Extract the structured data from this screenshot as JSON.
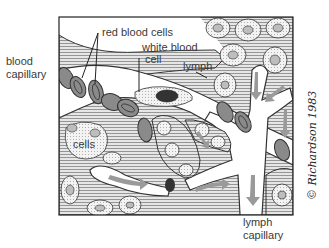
{
  "figure": {
    "labels": {
      "blood_capillary_line1": "blood",
      "blood_capillary_line2": "capillary",
      "red_blood_cells": "red blood cells",
      "white_blood_cell_line1": "white blood",
      "white_blood_cell_line2": "cell",
      "lymph": "lymph",
      "cells": "cells",
      "lymph_capillary_line1": "lymph",
      "lymph_capillary_line2": "capillary"
    },
    "signature": "© Richardson 1983",
    "colors": {
      "ink": "#333333",
      "red_blood_cell_fill": "#8a8a8a",
      "arrow_fill": "#9a9a9a",
      "background": "#ffffff"
    }
  }
}
